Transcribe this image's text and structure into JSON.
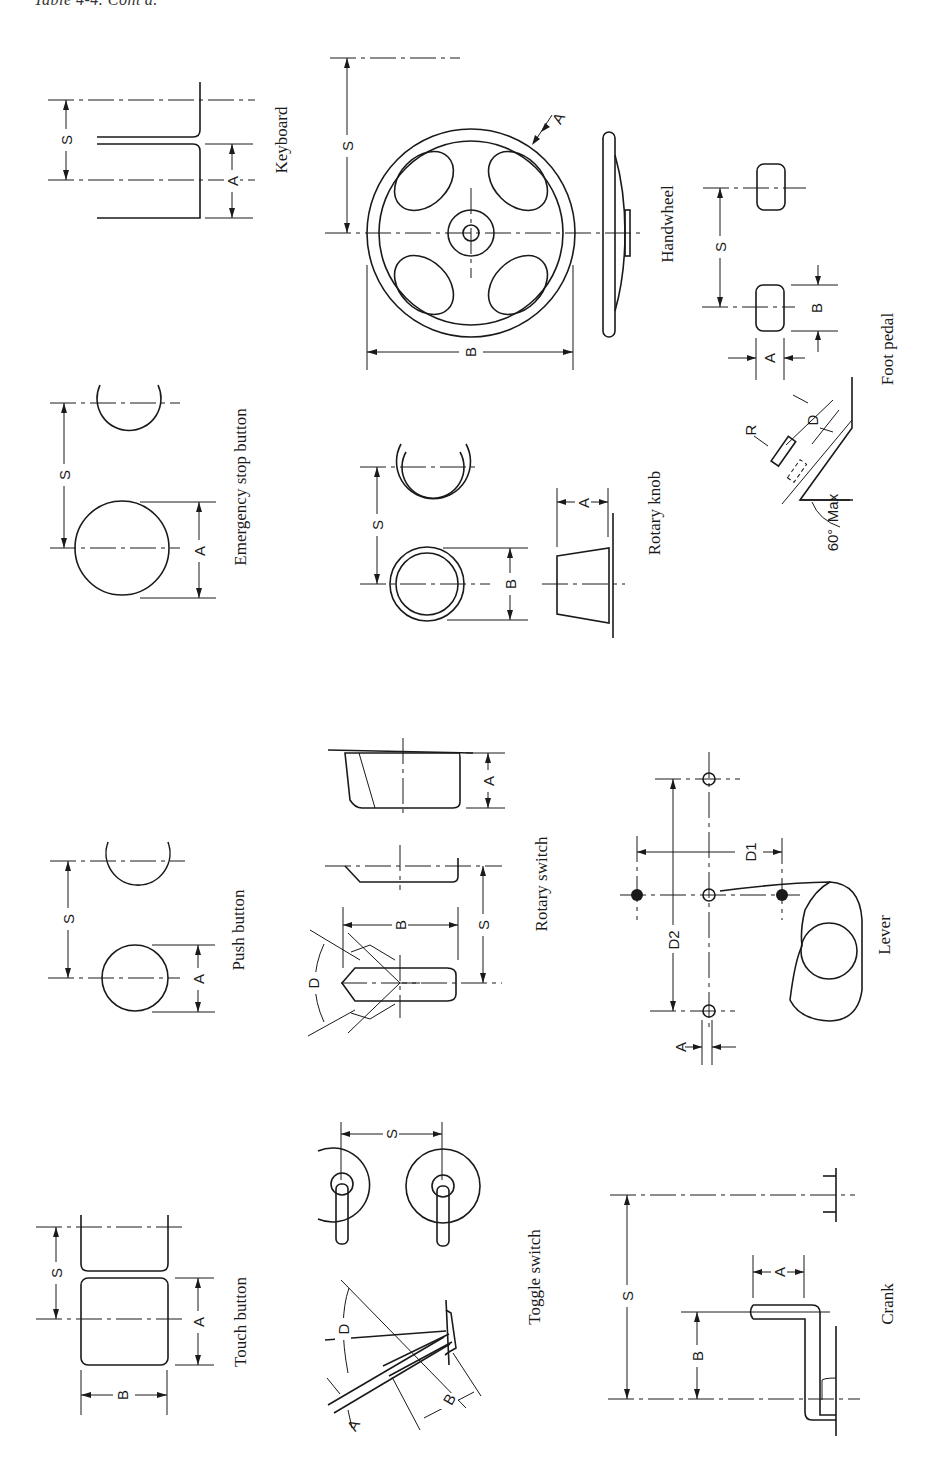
{
  "page": {
    "title": "Table 4-4. Cont'd."
  },
  "figure": {
    "orientation": "rotated-90-clockwise",
    "panels": [
      {
        "id": "keyboard",
        "label": "Keyboard",
        "dimensions": [
          "S",
          "A"
        ]
      },
      {
        "id": "handwheel",
        "label": "Handwheel",
        "dimensions": [
          "S",
          "A",
          "B"
        ]
      },
      {
        "id": "foot-pedal",
        "label": "Foot pedal",
        "dimensions": [
          "S",
          "A",
          "B",
          "R",
          "D",
          "Max",
          "60°"
        ]
      },
      {
        "id": "emergency-stop-button",
        "label": "Emergency stop button",
        "dimensions": [
          "S",
          "A"
        ]
      },
      {
        "id": "rotary-knob",
        "label": "Rotary knob",
        "dimensions": [
          "S",
          "B",
          "A"
        ]
      },
      {
        "id": "push-button",
        "label": "Push button",
        "dimensions": [
          "S",
          "A"
        ]
      },
      {
        "id": "rotary-switch",
        "label": "Rotary switch",
        "dimensions": [
          "D",
          "B",
          "S",
          "A"
        ]
      },
      {
        "id": "lever",
        "label": "Lever",
        "dimensions": [
          "D1",
          "D2",
          "A"
        ]
      },
      {
        "id": "touch-button",
        "label": "Touch button",
        "dimensions": [
          "S",
          "A",
          "B"
        ]
      },
      {
        "id": "toggle-switch",
        "label": "Toggle switch",
        "dimensions": [
          "S",
          "D",
          "A",
          "B"
        ]
      },
      {
        "id": "crank",
        "label": "Crank",
        "dimensions": [
          "S",
          "A",
          "B"
        ]
      }
    ]
  },
  "dim_letters": {
    "S": "S",
    "A": "A",
    "B": "B",
    "D": "D",
    "R": "R",
    "D1": "D1",
    "D2": "D2",
    "Max": "Max",
    "angle60": "60°"
  }
}
